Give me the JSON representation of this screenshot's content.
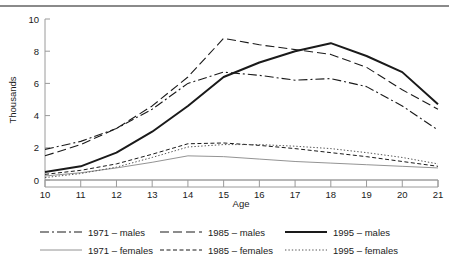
{
  "figure": {
    "top_rule": "horizontal-rule"
  },
  "chart_data": {
    "type": "line",
    "title": "",
    "xlabel": "Age",
    "ylabel": "Thousands",
    "x": [
      10,
      11,
      12,
      13,
      14,
      15,
      16,
      17,
      18,
      19,
      20,
      21
    ],
    "xlim": [
      10,
      21
    ],
    "ylim": [
      0,
      10
    ],
    "xticks": [
      "10",
      "11",
      "12",
      "13",
      "14",
      "15",
      "16",
      "17",
      "18",
      "19",
      "20",
      "21"
    ],
    "yticks": [
      "0",
      "2",
      "4",
      "6",
      "8",
      "10"
    ],
    "grid": false,
    "legend_position": "bottom",
    "series": [
      {
        "name": "1971 – males",
        "key": "1971-males",
        "style": "dash-dot",
        "width": 1.1,
        "color": "#1a1a1a",
        "values": [
          1.9,
          2.4,
          3.2,
          4.4,
          6.0,
          6.7,
          6.5,
          6.2,
          6.3,
          5.8,
          4.6,
          3.1
        ]
      },
      {
        "name": "1971 – females",
        "key": "1971-females",
        "style": "solid-thin",
        "width": 0.8,
        "color": "#777777",
        "values": [
          0.25,
          0.45,
          0.75,
          1.1,
          1.5,
          1.45,
          1.3,
          1.15,
          1.05,
          0.95,
          0.85,
          0.75
        ]
      },
      {
        "name": "1985 – males",
        "key": "1985-males",
        "style": "long-dash",
        "width": 1.1,
        "color": "#1a1a1a",
        "values": [
          1.5,
          2.2,
          3.2,
          4.6,
          6.4,
          8.8,
          8.4,
          8.1,
          7.8,
          7.0,
          5.6,
          4.4
        ]
      },
      {
        "name": "1985 – females",
        "key": "1985-females",
        "style": "short-dash",
        "width": 1.0,
        "color": "#1a1a1a",
        "values": [
          0.35,
          0.6,
          1.0,
          1.6,
          2.25,
          2.3,
          2.15,
          1.95,
          1.7,
          1.45,
          1.15,
          0.85
        ]
      },
      {
        "name": "1995 – males",
        "key": "1995-males",
        "style": "thick-solid",
        "width": 2.0,
        "color": "#1a1a1a",
        "values": [
          0.5,
          0.85,
          1.7,
          3.0,
          4.6,
          6.4,
          7.3,
          8.0,
          8.5,
          7.7,
          6.7,
          4.7
        ]
      },
      {
        "name": "1995 – females",
        "key": "1995-females",
        "style": "dotted",
        "width": 1.0,
        "color": "#555555",
        "values": [
          0.15,
          0.4,
          0.8,
          1.4,
          2.05,
          2.2,
          2.2,
          2.1,
          1.95,
          1.7,
          1.4,
          1.0
        ]
      }
    ]
  },
  "legend": {
    "entries": [
      {
        "label": "1971 – males"
      },
      {
        "label": "1985 – males"
      },
      {
        "label": "1995 – males"
      },
      {
        "label": "1971 – females"
      },
      {
        "label": "1985 – females"
      },
      {
        "label": "1995 – females"
      }
    ]
  }
}
